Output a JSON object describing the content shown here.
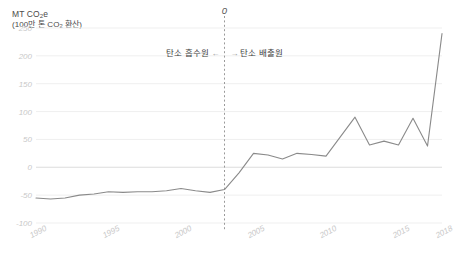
{
  "chart_data": {
    "type": "line",
    "subtitle": "(100만 톤 CO₂ 환산)",
    "xlabel": "",
    "ylabel": "MT CO₂e",
    "xlim": [
      1990,
      2018
    ],
    "ylim": [
      -100,
      250
    ],
    "yticks": [
      250,
      200,
      150,
      100,
      50,
      0,
      -50,
      -100
    ],
    "xticks": [
      1990,
      1995,
      2000,
      2005,
      2010,
      2015,
      2018
    ],
    "grid": true,
    "legend": "none",
    "line_color": "#8a8a8a",
    "grid_color": "#efefef",
    "zero_line_color": "#e2e2e2",
    "tick_label_color": "#c9c9c9",
    "x": [
      1990,
      1991,
      1992,
      1993,
      1994,
      1995,
      1996,
      1997,
      1998,
      1999,
      2000,
      2001,
      2002,
      2003,
      2004,
      2005,
      2006,
      2007,
      2008,
      2009,
      2010,
      2011,
      2012,
      2013,
      2014,
      2015,
      2016,
      2017,
      2018
    ],
    "values": [
      -55,
      -57,
      -55,
      -50,
      -48,
      -44,
      -45,
      -44,
      -44,
      -42,
      -38,
      -42,
      -45,
      -40,
      -10,
      25,
      22,
      15,
      25,
      23,
      20,
      55,
      90,
      40,
      47,
      40,
      88,
      38,
      240
    ],
    "annotations": [
      {
        "name": "divider",
        "kind": "vertical-dashed-line",
        "x": 2003,
        "label": "0",
        "left_label": "탄소 흡수원",
        "left_arrow": "←",
        "right_arrow": "→",
        "right_label": "탄소 배출원"
      }
    ]
  }
}
